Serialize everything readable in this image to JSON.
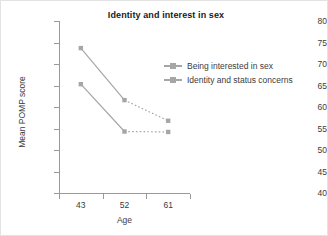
{
  "chart_data": {
    "type": "line",
    "title": "Identity and interest in sex",
    "xlabel": "Age",
    "ylabel": "Mean POMP score",
    "categories": [
      "43",
      "52",
      "61"
    ],
    "x": [
      43,
      52,
      61
    ],
    "series": [
      {
        "name": "Being interested in sex",
        "values": [
          73.7,
          61.6,
          56.8
        ],
        "color": "#a6a6a6",
        "marker": "square",
        "segment_styles": [
          "solid",
          "dotted"
        ]
      },
      {
        "name": "Identity and status concerns",
        "values": [
          65.3,
          54.3,
          54.2
        ],
        "color": "#a6a6a6",
        "marker": "square",
        "segment_styles": [
          "solid",
          "dotted"
        ]
      }
    ],
    "ylim": [
      40,
      80
    ],
    "yticks": [
      40,
      45,
      50,
      55,
      60,
      65,
      70,
      75,
      80
    ],
    "ytick_labels": [
      "40",
      "45",
      "50",
      "55",
      "60",
      "65",
      "70",
      "75",
      "80"
    ],
    "xtick_labels": [
      "43",
      "52",
      "61"
    ],
    "grid": false,
    "legend_position": "right",
    "axis_color": "#9a9a9a",
    "text_color": "#3c3c3c",
    "title_color": "#1a1a1a",
    "background": "#ffffff"
  },
  "legend": {
    "items": [
      {
        "label": "Being interested in sex"
      },
      {
        "label": "Identity and status concerns"
      }
    ]
  }
}
